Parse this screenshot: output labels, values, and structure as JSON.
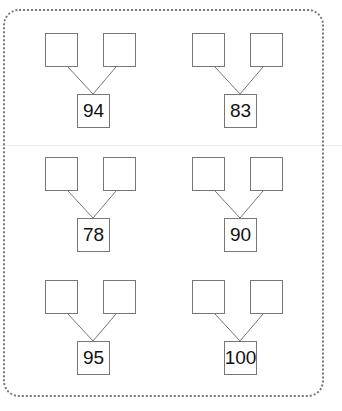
{
  "worksheet": {
    "type": "number-bond",
    "problems": [
      {
        "total": "94",
        "part_a": "",
        "part_b": ""
      },
      {
        "total": "83",
        "part_a": "",
        "part_b": ""
      },
      {
        "total": "78",
        "part_a": "",
        "part_b": ""
      },
      {
        "total": "90",
        "part_a": "",
        "part_b": ""
      },
      {
        "total": "95",
        "part_a": "",
        "part_b": ""
      },
      {
        "total": "100",
        "part_a": "",
        "part_b": ""
      }
    ]
  }
}
